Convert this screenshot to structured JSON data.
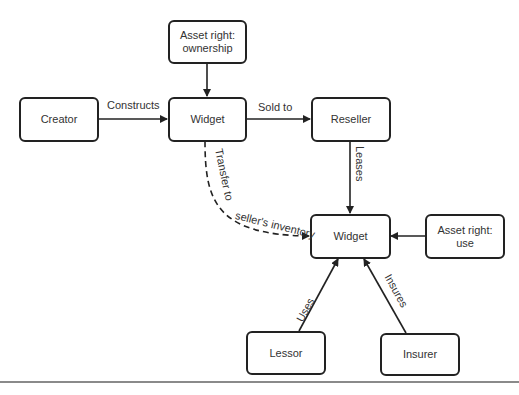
{
  "diagram": {
    "nodes": {
      "asset_ownership": {
        "line1": "Asset right:",
        "line2": "ownership"
      },
      "creator": {
        "label": "Creator"
      },
      "widget_top": {
        "label": "Widget"
      },
      "reseller": {
        "label": "Reseller"
      },
      "widget_bottom": {
        "label": "Widget"
      },
      "asset_use": {
        "line1": "Asset right:",
        "line2": "use"
      },
      "lessor": {
        "label": "Lessor"
      },
      "insurer": {
        "label": "Insurer"
      }
    },
    "edges": {
      "constructs": "Constructs",
      "sold_to": "Sold to",
      "leases": "Leases",
      "transfer": "Transfer to seller's inventory",
      "uses": "Uses",
      "insures": "Insures"
    },
    "colors": {
      "stroke": "#222222",
      "rule": "#8a8a8a"
    }
  }
}
